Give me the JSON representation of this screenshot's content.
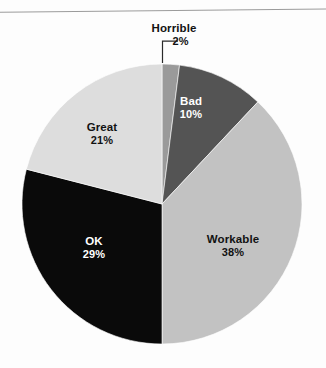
{
  "figure": {
    "background_color": "#fdfdfd",
    "rule_color": "#9b9b9b",
    "has_top_rule": true
  },
  "chart_data": {
    "type": "pie",
    "title": "",
    "subtitle": "",
    "xlabel": "",
    "ylabel": "",
    "legend_position": "none",
    "grid": false,
    "labels_inside": true,
    "value_suffix": "%",
    "start_angle_deg": 0,
    "direction": "clockwise",
    "categories": [
      "Horrible",
      "Bad",
      "Workable",
      "OK",
      "Great"
    ],
    "values": [
      2,
      10,
      38,
      29,
      21
    ],
    "value_labels": [
      "2%",
      "10%",
      "38%",
      "29%",
      "21%"
    ],
    "colors": [
      "#9a9a9a",
      "#545454",
      "#c2c2c2",
      "#0a0a0a",
      "#dddddd"
    ],
    "label_text_colors": [
      "#121212",
      "#ffffff",
      "#121212",
      "#ffffff",
      "#121212"
    ],
    "slices": [
      {
        "name": "Horrible",
        "value": 2,
        "value_label": "2%",
        "color": "#9a9a9a",
        "label_placement": "outside",
        "has_leader_line": true,
        "text_color": "#121212"
      },
      {
        "name": "Bad",
        "value": 10,
        "value_label": "10%",
        "color": "#545454",
        "label_placement": "inside",
        "has_leader_line": false,
        "text_color": "#ffffff"
      },
      {
        "name": "Workable",
        "value": 38,
        "value_label": "38%",
        "color": "#c2c2c2",
        "label_placement": "inside",
        "has_leader_line": false,
        "text_color": "#121212"
      },
      {
        "name": "OK",
        "value": 29,
        "value_label": "29%",
        "color": "#0a0a0a",
        "label_placement": "inside",
        "has_leader_line": false,
        "text_color": "#ffffff"
      },
      {
        "name": "Great",
        "value": 21,
        "value_label": "21%",
        "color": "#dddddd",
        "label_placement": "inside",
        "has_leader_line": false,
        "text_color": "#121212"
      }
    ],
    "total": 100,
    "geometry": {
      "center_x": 162,
      "center_y": 204,
      "radius": 140
    }
  }
}
